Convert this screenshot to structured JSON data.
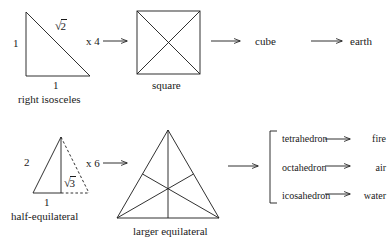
{
  "diagram": {
    "ink_color": "#1a1a1a",
    "background": "#ffffff"
  },
  "row_top": {
    "shape_a": {
      "name": "right isosceles",
      "caption": "right isosceles",
      "leg_vertical_label": "1",
      "leg_horizontal_label": "1",
      "hypotenuse_label_sign": "√",
      "hypotenuse_label_value": "2"
    },
    "multiplier": {
      "label": "x 4",
      "arrow": "arrow-right"
    },
    "shape_b": {
      "name": "square",
      "caption": "square"
    },
    "arrow_to_solid": "arrow-right",
    "solid": "cube",
    "arrow_to_element": "arrow-right",
    "element": "earth"
  },
  "row_bottom": {
    "shape_a": {
      "name": "half-equilateral",
      "caption": "half-equilateral",
      "hypotenuse_label": "2",
      "base_label": "1",
      "altitude_label_sign": "√",
      "altitude_label_value": "3"
    },
    "multiplier": {
      "label": "x 6",
      "arrow": "arrow-right"
    },
    "shape_b": {
      "name": "larger equilateral",
      "caption": "larger equilateral"
    },
    "arrow_to_bracket": "arrow-right",
    "bracket": {
      "style": "square-bracket-left",
      "rows": [
        {
          "solid": "tetrahedron",
          "arrow": "arrow-right",
          "element": "fire"
        },
        {
          "solid": "octahedron",
          "arrow": "arrow-right",
          "element": "air"
        },
        {
          "solid": "icosahedron",
          "arrow": "arrow-right",
          "element": "water"
        }
      ]
    }
  }
}
